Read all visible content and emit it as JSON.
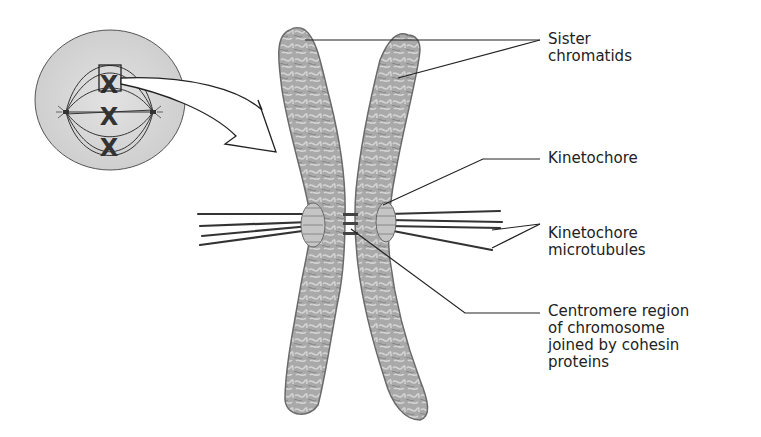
{
  "figure": {
    "inset": {
      "description": "Cell in metaphase with spindle and three chromosomes; top chromosome boxed and enlarged"
    },
    "labels": [
      {
        "id": "sister-chromatids",
        "text": "Sister\nchromatids"
      },
      {
        "id": "kinetochore",
        "text": "Kinetochore"
      },
      {
        "id": "kinetochore-microtubules",
        "text": "Kinetochore\nmicrotubules"
      },
      {
        "id": "centromere-region",
        "text": "Centromere region\nof chromosome\njoined by cohesin\nproteins"
      }
    ]
  },
  "colors": {
    "cell_fill": "#d8d8d8",
    "chromatid_fill": "#a8a8a8",
    "chromatid_stroke": "#6a6a6a",
    "line": "#222222"
  }
}
